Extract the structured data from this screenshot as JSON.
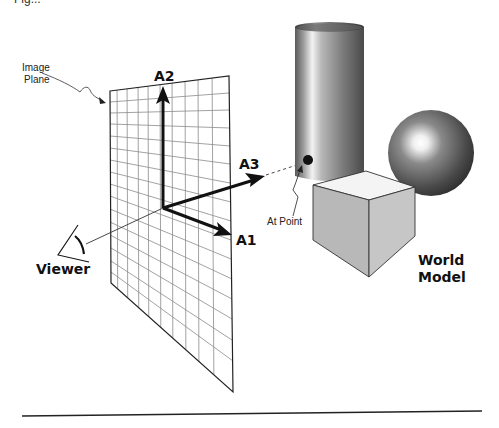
{
  "caption_cut": "Fig...",
  "labels": {
    "image_plane_line1": "Image",
    "image_plane_line2": "Plane",
    "axis_a1": "A1",
    "axis_a2": "A2",
    "axis_a3": "A3",
    "at_point": "At Point",
    "viewer": "Viewer",
    "world_model_line1": "World",
    "world_model_line2": "Model"
  },
  "objects": {
    "image_plane": {
      "type": "grid-plane",
      "columns": 10,
      "rows": 16
    },
    "cylinder": {
      "type": "shaded-cylinder"
    },
    "sphere": {
      "type": "shaded-sphere"
    },
    "cube": {
      "type": "shaded-cube"
    },
    "at_point_marker": {
      "type": "dot"
    },
    "viewer_eye": {
      "type": "eye-icon"
    }
  },
  "colors": {
    "ink": "#111111",
    "grid": "#8a8a8a",
    "cube_top": "#f4f4f4",
    "cube_front": "#b8b8b8",
    "cube_side": "#c4c4c4"
  }
}
